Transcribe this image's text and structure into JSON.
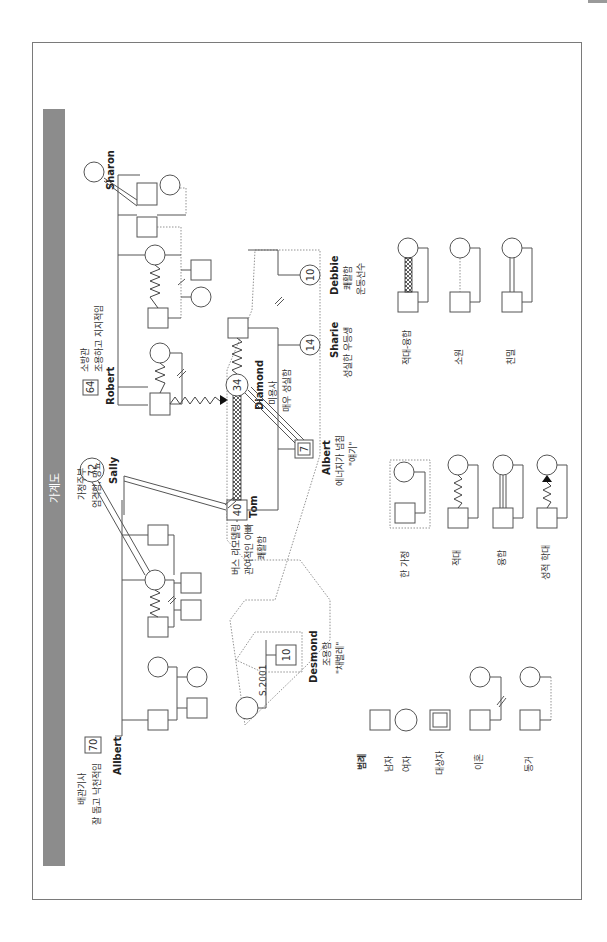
{
  "title": "가계도",
  "people": {
    "allbert": {
      "name": "Allbert",
      "age": "70",
      "note_line1": "배관기사",
      "note_line2": "잘 돕고 낙천적임"
    },
    "sally": {
      "name": "Sally",
      "age": "72",
      "note_line1": "가정주부",
      "note_line2": "엄격함, 당뇨"
    },
    "robert": {
      "name": "Robert",
      "age": "64",
      "note_line1": "소방관",
      "note_line2": "조용하고 지지적임"
    },
    "sharon": {
      "name": "Sharon"
    },
    "tom": {
      "name": "Tom",
      "age": "40",
      "note_line1": "버스 리모델링",
      "note_line2": "관여적인 아빠",
      "note_line3": "쾌활함"
    },
    "diamond": {
      "name": "Diamond",
      "age": "34",
      "note_line1": "미용사",
      "note_line2": "매우 성실함"
    },
    "albert": {
      "name": "Albert",
      "age": "7",
      "note_line1": "에너지가 넘침",
      "note_line2": "\"얘기\""
    },
    "sharie": {
      "name": "Sharie",
      "age": "14",
      "note_line1": "성실한 우등생"
    },
    "debbie": {
      "name": "Debbie",
      "age": "10",
      "note_line1": "쾌활함",
      "note_line2": "운동선수"
    },
    "desmond": {
      "name": "Desmond",
      "age": "10",
      "note_line1": "조용함",
      "note_line2": "\"채벌레\""
    },
    "desmond_mother": {
      "label": "S.2001"
    }
  },
  "legend": {
    "title": "범례",
    "items": [
      {
        "label": "남자",
        "icon": "male-square"
      },
      {
        "label": "여자",
        "icon": "female-circle"
      },
      {
        "label": "대상자",
        "icon": "index-person-double-square"
      },
      {
        "label": "이혼",
        "icon": "divorce-double-slash"
      },
      {
        "label": "동거",
        "icon": "cohabitation-dotted"
      },
      {
        "label": "한 가정",
        "icon": "household-dotted-box"
      },
      {
        "label": "적대",
        "icon": "hostile-zigzag"
      },
      {
        "label": "융합",
        "icon": "fused-triple-line"
      },
      {
        "label": "성적 학대",
        "icon": "sexual-abuse-arrow-zigzag"
      },
      {
        "label": "적대-융합",
        "icon": "hostile-fused"
      },
      {
        "label": "소원",
        "icon": "distant-dotted"
      },
      {
        "label": "친밀",
        "icon": "close-double-line"
      }
    ]
  },
  "colors": {
    "title_bar": "#8c8c8c",
    "line": "#555555",
    "frame": "#7a7a7a"
  }
}
